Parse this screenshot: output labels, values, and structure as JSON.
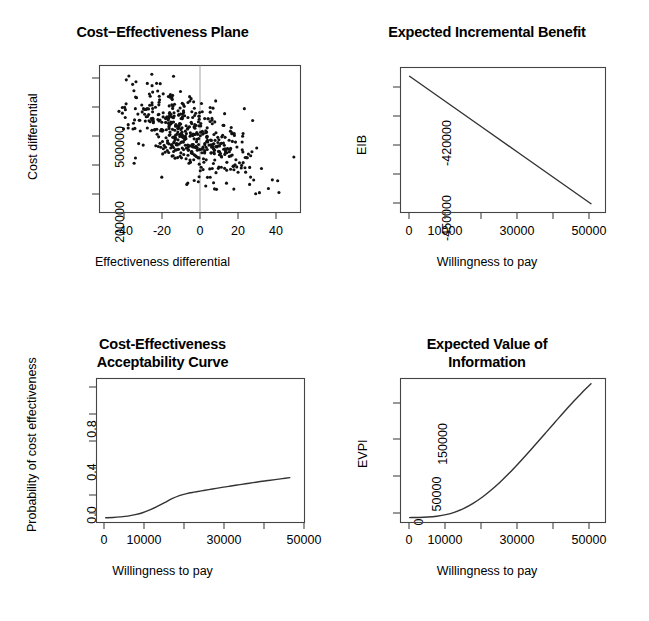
{
  "figure": {
    "background": "#ffffff",
    "foreground": "#000000",
    "layout": "2x2 panel grid",
    "panel_count": 4
  },
  "chart_data": [
    {
      "id": "cost-effectiveness-plane",
      "type": "scatter",
      "title": "Cost−Effectiveness Plane",
      "xlabel": "Effectiveness differential",
      "ylabel": "Cost differential",
      "xlim": [
        -50,
        57
      ],
      "ylim": [
        140000,
        640000
      ],
      "xticks": [
        -40,
        -20,
        0,
        20,
        40
      ],
      "xticklabels": [
        "-40",
        "-20",
        "0",
        "20",
        "40"
      ],
      "yticks": [
        200000,
        300000,
        400000,
        500000,
        600000
      ],
      "yticklabels": [
        "200000",
        "",
        "",
        "500000",
        ""
      ],
      "ylabel_shown": [
        "200000",
        "500000"
      ],
      "grid": false,
      "legend": null,
      "reference_lines": [
        {
          "orientation": "vertical",
          "x": 0,
          "color": "#999999"
        }
      ],
      "n_points": 500,
      "point_cloud": {
        "center_x": -1.5,
        "center_y": 400000,
        "sd_x": 15.5,
        "sd_y": 78000,
        "correlation": -0.55,
        "marker": "filled-circle",
        "marker_size_px": 2.0,
        "color": "#111111"
      }
    },
    {
      "id": "expected-incremental-benefit",
      "type": "line",
      "title": "Expected Incremental Benefit",
      "xlabel": "Willingness to pay",
      "ylabel": "EIB",
      "xlim": [
        -2500,
        54000
      ],
      "ylim": [
        -456000,
        -406500
      ],
      "xticks": [
        0,
        10000,
        20000,
        30000,
        40000,
        50000
      ],
      "xticklabels": [
        "0",
        "10000",
        "",
        "30000",
        "",
        "50000"
      ],
      "yticks": [
        -450000,
        -440000,
        -430000,
        -420000,
        -410000
      ],
      "yticklabels": [
        "-450000",
        "",
        "",
        "-420000",
        ""
      ],
      "grid": false,
      "legend": null,
      "x": [
        0,
        10000,
        20000,
        30000,
        40000,
        50000
      ],
      "values": [
        -409500,
        -418200,
        -426900,
        -435600,
        -444300,
        -453000
      ]
    },
    {
      "id": "cost-effectiveness-acceptability-curve",
      "type": "line",
      "title": "Cost-Effectiveness\nAcceptability Curve",
      "title_lines": [
        "Cost-Effectiveness",
        "Acceptability Curve"
      ],
      "xlabel": "Willingness to pay",
      "ylabel": "Probability of cost effectiveness",
      "xlim": [
        -2500,
        54000
      ],
      "ylim": [
        -0.03,
        1.0
      ],
      "xticks": [
        0,
        10000,
        20000,
        30000,
        40000,
        50000
      ],
      "xticklabels": [
        "0",
        "10000",
        "",
        "30000",
        "",
        "50000"
      ],
      "yticks": [
        0.0,
        0.2,
        0.4,
        0.6,
        0.8,
        1.0
      ],
      "yticklabels": [
        "0.0",
        "",
        "0.4",
        "",
        "0.8",
        ""
      ],
      "grid": false,
      "legend": null,
      "x": [
        0,
        2000,
        4000,
        6000,
        8000,
        10000,
        12000,
        14000,
        16000,
        18000,
        20000,
        22000,
        24000,
        26000,
        28000,
        30000,
        32000,
        34000,
        36000,
        38000,
        40000,
        42000,
        44000,
        46000,
        48000,
        50000
      ],
      "values": [
        0.004,
        0.006,
        0.01,
        0.016,
        0.026,
        0.04,
        0.06,
        0.085,
        0.112,
        0.14,
        0.162,
        0.177,
        0.187,
        0.196,
        0.205,
        0.214,
        0.223,
        0.231,
        0.239,
        0.247,
        0.255,
        0.263,
        0.27,
        0.277,
        0.284,
        0.291
      ]
    },
    {
      "id": "expected-value-of-information",
      "type": "line",
      "title": "Expected Value of\nInformation",
      "title_lines": [
        "Expected Value of",
        "Information"
      ],
      "xlabel": "Willingness to pay",
      "ylabel": "EVPI",
      "xlim": [
        -2500,
        54000
      ],
      "ylim": [
        -6000,
        182000
      ],
      "xticks": [
        0,
        10000,
        20000,
        30000,
        40000,
        50000
      ],
      "xticklabels": [
        "0",
        "10000",
        "",
        "30000",
        "",
        "50000"
      ],
      "yticks": [
        0,
        50000,
        100000,
        150000
      ],
      "yticklabels": [
        "0",
        "50000",
        "",
        "150000"
      ],
      "grid": false,
      "legend": null,
      "x": [
        0,
        2500,
        5000,
        7500,
        10000,
        12500,
        15000,
        17500,
        20000,
        22500,
        25000,
        27500,
        30000,
        32500,
        35000,
        37500,
        40000,
        42500,
        45000,
        47500,
        50000
      ],
      "values": [
        400,
        600,
        1100,
        2200,
        4200,
        7600,
        12500,
        19000,
        27000,
        36500,
        47000,
        58500,
        71000,
        84000,
        97500,
        111000,
        124500,
        138000,
        151000,
        163500,
        175000
      ]
    }
  ]
}
